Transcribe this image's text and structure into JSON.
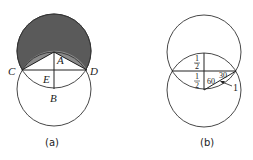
{
  "figure_a": {
    "caption": "(a)",
    "points": {
      "A": "A",
      "B": "B",
      "C": "C",
      "D": "D",
      "E": "E"
    },
    "colors": {
      "shade_dark": "#5a5a5a",
      "shade_light": "#8a8a8a",
      "stroke": "#333333"
    }
  },
  "figure_b": {
    "caption": "(b)",
    "labels": {
      "half_top_num": "1",
      "half_top_den": "2",
      "half_bottom_num": "1",
      "half_bottom_den": "2",
      "angle_60": "60",
      "angle_30": "30",
      "radius": "1"
    }
  }
}
